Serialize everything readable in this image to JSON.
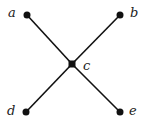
{
  "diagram": {
    "type": "graph",
    "nodes": [
      {
        "id": "a",
        "label": "a",
        "x": 27,
        "y": 15,
        "shape": "circle"
      },
      {
        "id": "b",
        "label": "b",
        "x": 120,
        "y": 15,
        "shape": "circle"
      },
      {
        "id": "c",
        "label": "c",
        "x": 72,
        "y": 64,
        "shape": "square"
      },
      {
        "id": "d",
        "label": "d",
        "x": 26,
        "y": 112,
        "shape": "circle"
      },
      {
        "id": "e",
        "label": "e",
        "x": 120,
        "y": 112,
        "shape": "circle"
      }
    ],
    "edges": [
      {
        "from": "a",
        "to": "c"
      },
      {
        "from": "b",
        "to": "c"
      },
      {
        "from": "d",
        "to": "c"
      },
      {
        "from": "e",
        "to": "c"
      }
    ],
    "colors": {
      "ink": "#111111",
      "background": "#ffffff"
    }
  }
}
